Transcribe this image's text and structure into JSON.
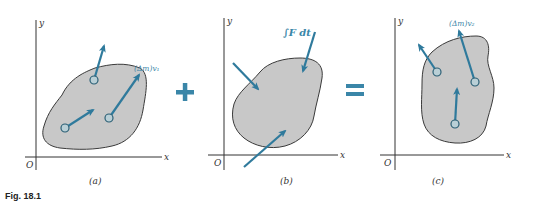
{
  "figure": {
    "caption": "Fig. 18.1",
    "colors": {
      "accent": "#3a86a8",
      "arrow": "#2f7a9c",
      "blob_fill": "#c8c8c8",
      "blob_stroke": "#3a3a3a",
      "axis": "#333333",
      "circle_fill": "#b9cfd6"
    },
    "operators": {
      "plus": "+",
      "equals": "="
    },
    "panels": [
      {
        "id": "a",
        "label": "(a)",
        "axis_x": "x",
        "axis_y": "y",
        "origin": "O",
        "vector_label": "(Δm)v₁",
        "particles": 3
      },
      {
        "id": "b",
        "label": "(b)",
        "axis_x": "x",
        "axis_y": "y",
        "origin": "O",
        "impulse_label": "∫F dt",
        "impulses": 3
      },
      {
        "id": "c",
        "label": "(c)",
        "axis_x": "x",
        "axis_y": "y",
        "origin": "O",
        "vector_label": "(Δm)v₂",
        "particles": 3
      }
    ]
  }
}
